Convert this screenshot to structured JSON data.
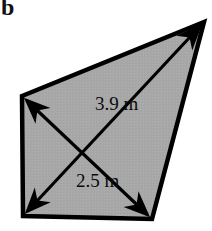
{
  "figure": {
    "part_label": "b",
    "background_color": "#ffffff",
    "shape": {
      "name": "quadrilateral",
      "fill_color": "#a8a8a8",
      "stroke_color": "#000000",
      "stroke_width": 4,
      "vertices": [
        {
          "name": "top-left",
          "x": 22,
          "y": 96
        },
        {
          "name": "top-right",
          "x": 204,
          "y": 22
        },
        {
          "name": "bottom-right",
          "x": 152,
          "y": 219
        },
        {
          "name": "bottom-left",
          "x": 23,
          "y": 216
        }
      ]
    },
    "dimensions": [
      {
        "id": "diagonal-a",
        "label": "3.9 m",
        "value": 3.9,
        "unit": "m",
        "from": {
          "x": 23,
          "y": 216
        },
        "to": {
          "x": 204,
          "y": 22
        },
        "arrowheads": "both",
        "color": "#000000"
      },
      {
        "id": "diagonal-b",
        "label": "2.5 m",
        "value": 2.5,
        "unit": "m",
        "from": {
          "x": 22,
          "y": 96
        },
        "to": {
          "x": 152,
          "y": 219
        },
        "arrowheads": "both",
        "color": "#000000"
      }
    ]
  }
}
